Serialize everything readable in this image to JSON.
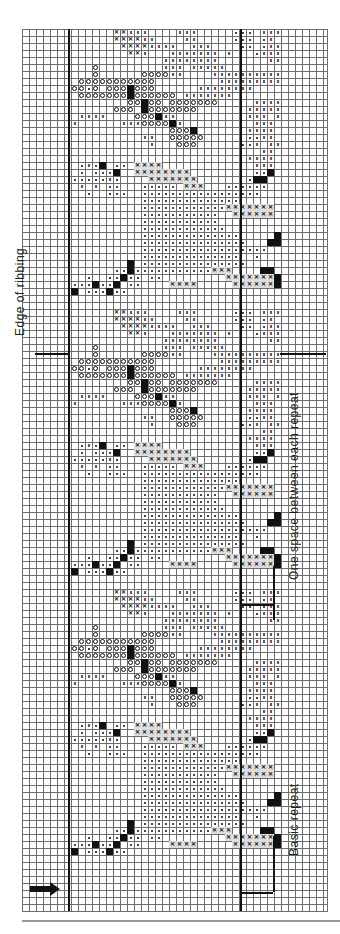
{
  "chart_title": "",
  "labels": {
    "edge": "Edge of ribbing",
    "space": "One space between each repeat",
    "basic": "Basic repeat"
  },
  "legend_symbols": [
    {
      "code": "x",
      "meaning": "cross stitch color A"
    },
    {
      "code": "o",
      "meaning": "circle stitch color B"
    },
    {
      "code": "#",
      "meaning": "filled square color C"
    },
    {
      "code": "n",
      "meaning": "tally-mark stitch color D"
    },
    {
      "code": "d",
      "meaning": "dot stitch color E"
    },
    {
      "code": "s",
      "meaning": "shaded cross (outlined block)"
    }
  ],
  "grid": {
    "cell_px": 7,
    "left_px": 22,
    "top_px": 29,
    "columns": 43,
    "rows": 126,
    "chart_left_col": 6.5,
    "chart_right_col": 31
  },
  "repeat": {
    "count": 3,
    "period_rows": 40,
    "start_rows": [
      0,
      40,
      80
    ],
    "rows_start_col": 7,
    "rows": [
      "......xxnnn....nnn.....ddd.nnn",
      "......xxxxnn....nn.....ddd.dn.",
      ".......xxxxnnnn..nnn....dd.dnn",
      "........xxn...nnnnnnn.n...dnnn",
      ".............nnnnnnnn.......nn",
      "...o.........nnn.nnnnn........",
      "...o......oooonn....nnnnnnnnnn",
      ".ooooooooooo.........nnnnnnnnn",
      "oodo.ooo#ooo......nnnnnnnn....",
      ".ooooooo#oooooo.nnnnnnn.......",
      "........oo#oo.ooooooo.....nnnn",
      "......ooo.#ooooooo.......nnnnn",
      ".nnnn....ooo#nn..........nnn.n",
      "n......nnnoooo#n..........nnn.",
      "..............ooo#.......nnnn.",
      "..........nn..ooooo......ddnn.",
      "...........n...ooo......ddn.nn",
      "...........................nn.",
      ".........................nnnn.",
      ".dnd#.dd.ssss.............nnn.",
      ".d.ddd#..ssssssss.........dd#.",
      "dddddnd....sssssss.......d##..",
      ".n.n.dd...ddddd.sss...dddddd..",
      "..d..ddd..ddddddddddddddddd...",
      "..........dddddddddddddd......",
      "..........ddddddddddddsssssss.",
      "..........ddddddddddd..ssssss.",
      "..........ddddddddddd.........",
      "..........dddddddddddd........",
      "..........dddddddddddddd.....#",
      "..........ddddddddddddddd...##",
      "..........dddddddddddddddddd..",
      "..........dddddddddddddd..d...",
      "........#.ddddddddddddddd.....",
      "......dd#dddddddddddsss....##.",
      "..d..dd#dd.dd.........sssssss#",
      "ddd#dd#.dd....ssss.....ssssss#",
      "#.ddd#dd........................",
      "...............................",
      "..............................."
    ]
  },
  "markers": {
    "left_thick_col_x": 68,
    "right_thick_col_x": 240,
    "right_outer_x": 273,
    "horizontal_rules": [
      {
        "x1": 35,
        "x2": 68,
        "y": 353
      },
      {
        "x1": 280,
        "x2": 326,
        "y": 353
      },
      {
        "x1": 240,
        "x2": 273,
        "y": 604
      },
      {
        "x1": 240,
        "x2": 273,
        "y": 892
      }
    ],
    "bracket_verticals": [
      {
        "x": 273,
        "y1": 566,
        "y2": 606
      },
      {
        "x": 273,
        "y1": 836,
        "y2": 892
      },
      {
        "x": 273,
        "y1": 588,
        "y2": 620
      }
    ]
  },
  "start_arrow": "right-arrow"
}
